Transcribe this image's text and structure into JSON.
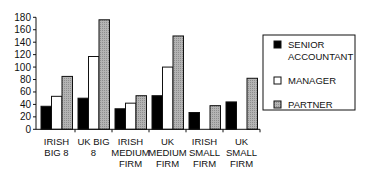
{
  "chart_data": {
    "type": "bar",
    "title": "",
    "xlabel": "",
    "ylabel": "",
    "ylim": [
      0,
      180
    ],
    "yticks": [
      0,
      20,
      40,
      60,
      80,
      100,
      120,
      140,
      160,
      180
    ],
    "grid": false,
    "legend_position": "right",
    "categories": [
      [
        "IRISH",
        "BIG 8"
      ],
      [
        "UK BIG",
        "8"
      ],
      [
        "IRISH",
        "MEDIUM",
        "FIRM"
      ],
      [
        "UK",
        "MEDIUM",
        "FIRM"
      ],
      [
        "IRISH",
        "SMALL",
        "FIRM"
      ],
      [
        "UK",
        "SMALL",
        "FIRM"
      ]
    ],
    "series": [
      {
        "name": "SENIOR ACCOUNTANT",
        "legend_lines": [
          "SENIOR",
          "ACCOUNTANT"
        ],
        "color": "#000000",
        "values": [
          37,
          50,
          33,
          54,
          27,
          44
        ]
      },
      {
        "name": "MANAGER",
        "legend_lines": [
          "MANAGER"
        ],
        "color": "#ffffff",
        "values": [
          53,
          117,
          42,
          100,
          0,
          0
        ]
      },
      {
        "name": "PARTNER",
        "legend_lines": [
          "PARTNER"
        ],
        "color": "#b0b0b0",
        "values": [
          85,
          176,
          54,
          150,
          38,
          82
        ]
      }
    ]
  }
}
